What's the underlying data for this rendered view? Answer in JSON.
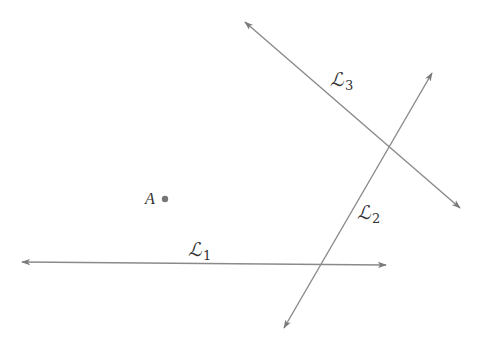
{
  "diagram": {
    "stroke_color": "#8a8a8a",
    "point_color": "#777777",
    "text_color": "#333333",
    "point": {
      "label": "A",
      "x": 165,
      "y": 199
    },
    "lines": [
      {
        "id": "L1",
        "name": "ℒ",
        "subscript": "1",
        "x1": 22,
        "y1": 262,
        "x2": 386,
        "y2": 265,
        "label_x": 188,
        "label_y": 240
      },
      {
        "id": "L2",
        "name": "ℒ",
        "subscript": "2",
        "x1": 432,
        "y1": 73,
        "x2": 284,
        "y2": 328,
        "label_x": 357,
        "label_y": 203
      },
      {
        "id": "L3",
        "name": "ℒ",
        "subscript": "3",
        "x1": 245,
        "y1": 22,
        "x2": 460,
        "y2": 208,
        "label_x": 330,
        "label_y": 70
      }
    ]
  }
}
